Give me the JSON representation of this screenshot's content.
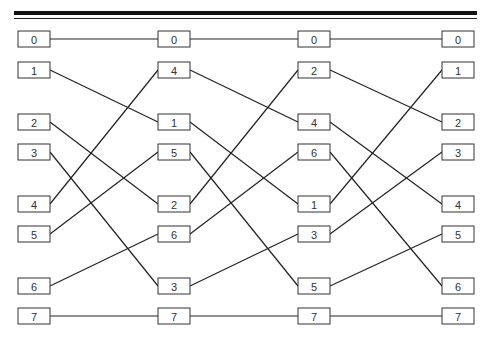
{
  "diagram": {
    "title": "",
    "type": "permutation-network",
    "columns": [
      {
        "name": "stage-0",
        "nodes": [
          "0",
          "1",
          "2",
          "3",
          "4",
          "5",
          "6",
          "7"
        ]
      },
      {
        "name": "stage-1",
        "nodes": [
          "0",
          "4",
          "1",
          "5",
          "2",
          "6",
          "3",
          "7"
        ]
      },
      {
        "name": "stage-2",
        "nodes": [
          "0",
          "2",
          "4",
          "6",
          "1",
          "3",
          "5",
          "7"
        ]
      },
      {
        "name": "stage-3",
        "nodes": [
          "0",
          "1",
          "2",
          "3",
          "4",
          "5",
          "6",
          "7"
        ]
      }
    ],
    "edges_rule": "connect equal labels between adjacent columns",
    "colors": {
      "line": "#222222",
      "box_border": "#333333",
      "text": "#333333",
      "background": "#ffffff"
    }
  }
}
